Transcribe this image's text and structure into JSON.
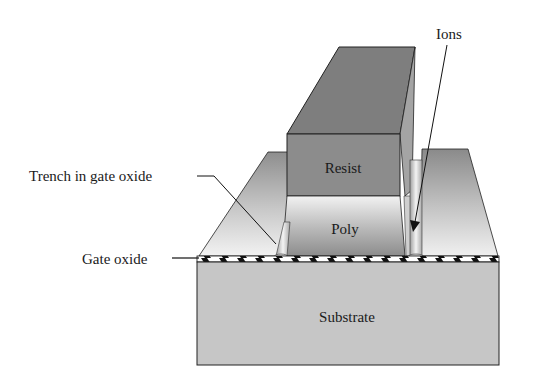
{
  "diagram": {
    "type": "3d-cross-section",
    "labels": {
      "ions": "Ions",
      "trench": "Trench in gate oxide",
      "gate_oxide": "Gate oxide",
      "resist": "Resist",
      "poly": "Poly",
      "substrate": "Substrate"
    },
    "colors": {
      "resist_front": "#8a8a8a",
      "resist_top": "#7a7a7a",
      "poly_front": "#b5b5b5",
      "platform_top": "#9a9a9a",
      "substrate": "#c4c4c4",
      "oxide_fill": "#ffffff",
      "oxide_hatch": "#111111",
      "stroke": "#222222"
    }
  }
}
